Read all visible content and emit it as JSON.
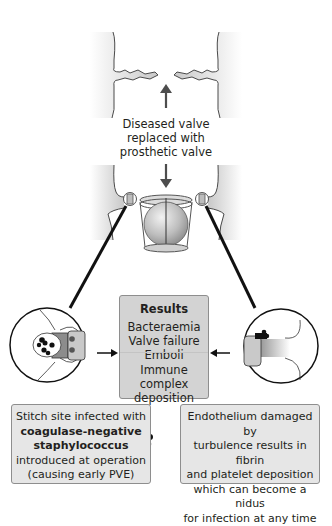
{
  "diagram": {
    "top_caption": {
      "line1": "Diseased valve",
      "line2": "replaced with",
      "line3": "prosthetic valve"
    },
    "results_box": {
      "title": "Results",
      "items": [
        "Bacteraemia",
        "Valve failure",
        "Emboli",
        "Immune complex",
        "deposition"
      ]
    },
    "left_box": {
      "line1": "Stitch site infected with",
      "line2_bold": "coagulase-negative",
      "line3_bold": "staphylococcus",
      "line4": "introduced at operation",
      "line5": "(causing early PVE)"
    },
    "right_box": {
      "line1": "Endothelium damaged by",
      "line2": "turbulence results in fibrin",
      "line3": "and platelet deposition",
      "line4": "which can become a nidus",
      "line5": "for infection at any time"
    },
    "colors": {
      "box_fill": "#e6e6e6",
      "results_fill": "#d3d3d3",
      "outline": "#231f20",
      "tissue_gray": "#b3b3b3"
    }
  }
}
